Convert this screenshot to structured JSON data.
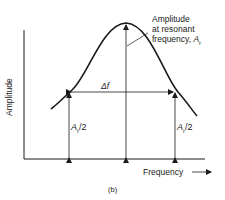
{
  "diagram": {
    "caption": "(b)",
    "y_axis_label": "Amplitude",
    "x_axis_label": "Frequency",
    "peak_annotation": {
      "line1": "Amplitude",
      "line2": "at resonant",
      "line3": "frequency, ",
      "symbol": "A",
      "subscript": "r"
    },
    "bandwidth_label": "Δf",
    "half_amplitude_left": {
      "symbol": "A",
      "subscript": "r",
      "suffix": "/2"
    },
    "half_amplitude_right": {
      "symbol": "A",
      "subscript": "r",
      "suffix": "/2"
    }
  }
}
